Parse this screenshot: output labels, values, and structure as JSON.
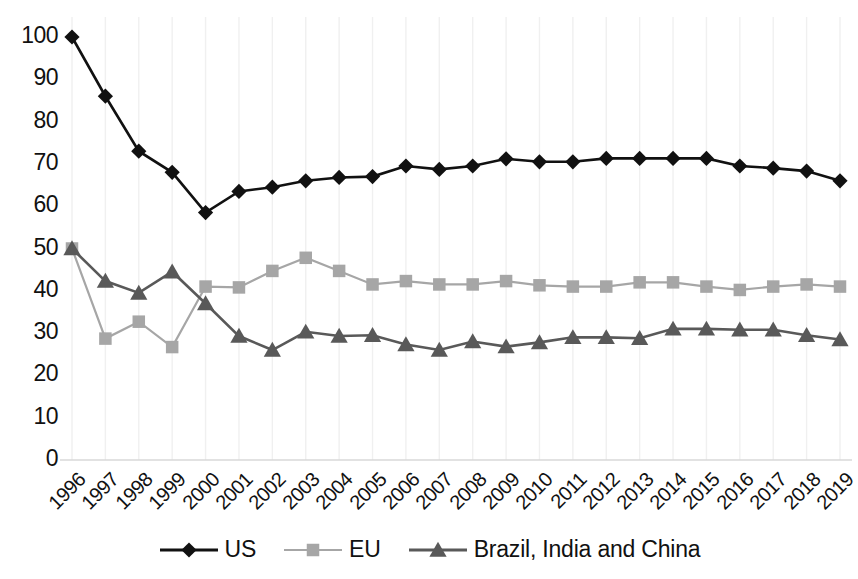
{
  "chart_data": {
    "type": "line",
    "title": "",
    "subtitle": "",
    "xlabel": "",
    "ylabel": "",
    "grid": "vertical-only",
    "legend_position": "bottom-center",
    "ylim": [
      0,
      100
    ],
    "yticks": [
      0,
      10,
      20,
      30,
      40,
      50,
      60,
      70,
      80,
      90,
      100
    ],
    "categories": [
      "1996",
      "1997",
      "1998",
      "1999",
      "2000",
      "2001",
      "2002",
      "2003",
      "2004",
      "2005",
      "2006",
      "2007",
      "2008",
      "2009",
      "2010",
      "2011",
      "2012",
      "2013",
      "2014",
      "2015",
      "2016",
      "2017",
      "2018",
      "2019"
    ],
    "series": [
      {
        "name": "US",
        "marker": "diamond",
        "color": "#111111",
        "values": [
          100,
          86,
          73,
          68,
          58.5,
          63.5,
          64.5,
          66,
          66.8,
          67,
          69.5,
          68.7,
          69.5,
          71.2,
          70.5,
          70.5,
          71.3,
          71.3,
          71.3,
          71.3,
          69.5,
          69,
          68.3,
          66
        ]
      },
      {
        "name": "EU",
        "marker": "square",
        "color": "#a6a6a6",
        "values": [
          50,
          28.7,
          32.7,
          26.7,
          41,
          40.8,
          44.7,
          47.8,
          44.7,
          41.5,
          42.3,
          41.5,
          41.5,
          42.3,
          41.3,
          41,
          41,
          42,
          42,
          41,
          40.2,
          41,
          41.5,
          41
        ]
      },
      {
        "name": "Brazil, India and China",
        "marker": "triangle",
        "color": "#595959",
        "values": [
          50,
          42.3,
          39.5,
          44.5,
          37,
          29.3,
          26,
          30.3,
          29.3,
          29.5,
          27.3,
          26,
          28,
          26.8,
          27.8,
          29,
          29,
          28.8,
          31,
          31,
          30.8,
          30.8,
          29.5,
          28.5
        ]
      }
    ]
  },
  "legend": {
    "items": [
      {
        "label": "US",
        "symbol": "diamond-marker-icon",
        "color": "#111111"
      },
      {
        "label": "EU",
        "symbol": "square-marker-icon",
        "color": "#a6a6a6"
      },
      {
        "label": "Brazil, India and China",
        "symbol": "triangle-marker-icon",
        "color": "#595959"
      }
    ]
  }
}
